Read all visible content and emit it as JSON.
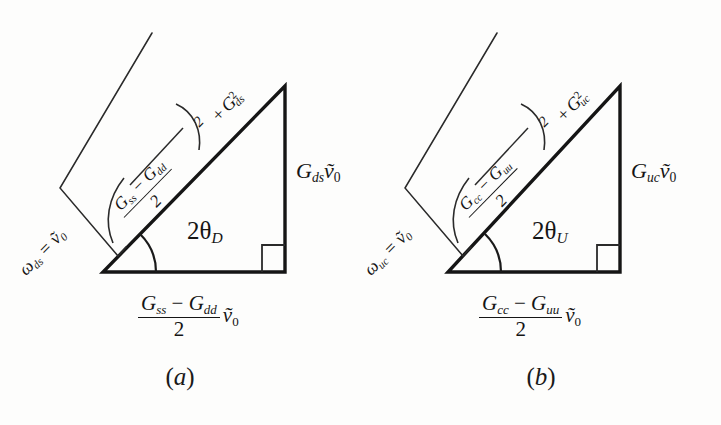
{
  "figure": {
    "type": "geometric-diagram",
    "background_color": "#fdfdfc",
    "stroke_color": "#151515"
  },
  "panels": [
    {
      "id": "a",
      "caption": "(a)",
      "caption_letter": "a",
      "angle_label": "2θ",
      "angle_subscript": "D",
      "vertical_side": {
        "symbol": "G",
        "subscript": "ds",
        "factor": "ṽ",
        "factor_subscript": "0",
        "text": "G_ds ṽ₀"
      },
      "base_side": {
        "numerator_first": "G",
        "numerator_first_sub": "ss",
        "minus": "−",
        "numerator_second": "G",
        "numerator_second_sub": "dd",
        "denominator": "2",
        "factor": "ṽ",
        "factor_subscript": "0",
        "text": "(G_ss − G_dd)/2 ṽ₀"
      },
      "hypotenuse": {
        "omega_symbol": "ω",
        "omega_subscript": "ds",
        "equals": "=",
        "omega_factor": "ṽ",
        "omega_factor_sub": "0",
        "omega_text": "ω_ds = ṽ₀",
        "sqrt_inner_num_first": "G",
        "sqrt_inner_num_first_sub": "ss",
        "sqrt_inner_minus": "−",
        "sqrt_inner_num_second": "G",
        "sqrt_inner_num_second_sub": "dd",
        "sqrt_inner_den": "2",
        "sqrt_power": "2",
        "sqrt_plus": "+",
        "sqrt_term_symbol": "G",
        "sqrt_term_sub": "ds",
        "sqrt_term_sup": "2",
        "sqrt_text": "√( ((G_ss − G_dd)/2)² + G²_ds )"
      }
    },
    {
      "id": "b",
      "caption": "(b)",
      "caption_letter": "b",
      "angle_label": "2θ",
      "angle_subscript": "U",
      "vertical_side": {
        "symbol": "G",
        "subscript": "uc",
        "factor": "ṽ",
        "factor_subscript": "0",
        "text": "G_uc ṽ₀"
      },
      "base_side": {
        "numerator_first": "G",
        "numerator_first_sub": "cc",
        "minus": "−",
        "numerator_second": "G",
        "numerator_second_sub": "uu",
        "denominator": "2",
        "factor": "ṽ",
        "factor_subscript": "0",
        "text": "(G_cc − G_uu)/2 ṽ₀"
      },
      "hypotenuse": {
        "omega_symbol": "ω",
        "omega_subscript": "uc",
        "equals": "=",
        "omega_factor": "ṽ",
        "omega_factor_sub": "0",
        "omega_text": "ω_uc = ṽ₀",
        "sqrt_inner_num_first": "G",
        "sqrt_inner_num_first_sub": "cc",
        "sqrt_inner_minus": "−",
        "sqrt_inner_num_second": "G",
        "sqrt_inner_num_second_sub": "uu",
        "sqrt_inner_den": "2",
        "sqrt_power": "2",
        "sqrt_plus": "+",
        "sqrt_term_symbol": "G",
        "sqrt_term_sub": "uc",
        "sqrt_term_sup": "2",
        "sqrt_text": "√( ((G_cc − G_uu)/2)² + G²_uc )"
      }
    }
  ]
}
